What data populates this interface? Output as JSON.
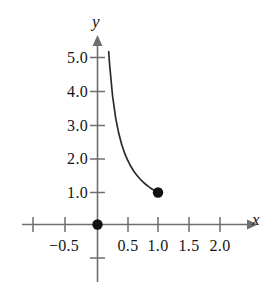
{
  "chart_data": {
    "type": "line",
    "title": "",
    "xlabel": "x",
    "ylabel": "y",
    "xlim": [
      -1.2,
      2.35
    ],
    "ylim": [
      -1.1,
      5.7
    ],
    "grid": false,
    "legend": null,
    "function": "y = 1/x",
    "x": [
      0.185,
      0.2,
      0.25,
      0.3,
      0.35,
      0.4,
      0.45,
      0.5,
      0.55,
      0.6,
      0.65,
      0.7,
      0.75,
      0.8,
      0.85,
      0.9,
      0.95,
      1.0
    ],
    "y": [
      5.4,
      5.0,
      4.0,
      3.333,
      2.857,
      2.5,
      2.222,
      2.0,
      1.818,
      1.667,
      1.538,
      1.429,
      1.333,
      1.25,
      1.176,
      1.111,
      1.053,
      1.0
    ],
    "xticks": [
      -1.0,
      -0.5,
      0.5,
      1.0,
      1.5,
      2.0
    ],
    "xtick_labels": [
      "",
      "−0.5",
      "0.5",
      "1.0",
      "1.5",
      "2.0"
    ],
    "yticks": [
      5.0,
      4.0,
      3.0,
      2.0,
      1.0,
      -1.0
    ],
    "ytick_labels": [
      "5.0",
      "4.0",
      "3.0",
      "2.0",
      "1.0",
      ""
    ],
    "points": [
      {
        "name": "origin-point",
        "x": 0.0,
        "y": 0.0,
        "style": "filled"
      },
      {
        "name": "curve-endpoint",
        "x": 1.0,
        "y": 1.0,
        "style": "filled"
      }
    ],
    "curve_color": "#2b2b2b",
    "axis_color": "#6e6e6e",
    "point_color": "#111111"
  },
  "axes": {
    "x_name": "x",
    "y_name": "y"
  },
  "ytick_labels": {
    "t50": "5.0",
    "t40": "4.0",
    "t30": "3.0",
    "t20": "2.0",
    "t10": "1.0"
  },
  "xtick_labels": {
    "tm05": "−0.5",
    "t05": "0.5",
    "t10": "1.0",
    "t15": "1.5",
    "t20": "2.0"
  }
}
